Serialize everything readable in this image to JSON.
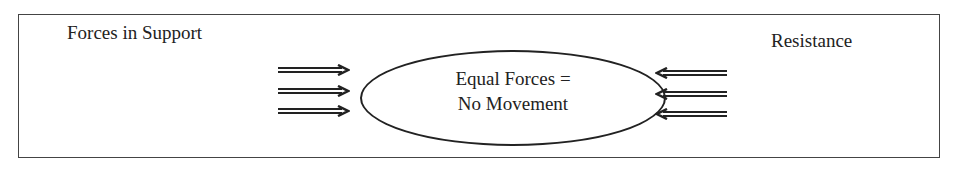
{
  "diagram": {
    "left_label": "Forces in Support",
    "right_label": "Resistance",
    "center_line1": "Equal Forces =",
    "center_line2": "No Movement",
    "left_arrows": 3,
    "right_arrows": 3
  }
}
